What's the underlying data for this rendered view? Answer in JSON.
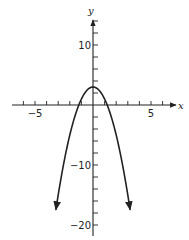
{
  "chart_data": {
    "type": "line",
    "title": "",
    "xlabel": "x",
    "ylabel": "y",
    "xlim": [
      -7.5,
      7.5
    ],
    "ylim": [
      -22,
      15
    ],
    "x_ticks": [
      -6,
      -5,
      -4,
      -3,
      -2,
      -1,
      1,
      2,
      3,
      4,
      5,
      6
    ],
    "x_tick_labels": [
      {
        "value": -5,
        "label": "−5"
      },
      {
        "value": 5,
        "label": "5"
      }
    ],
    "y_ticks": [
      14,
      12,
      10,
      8,
      6,
      4,
      2,
      -2,
      -4,
      -6,
      -8,
      -10,
      -12,
      -14,
      -16,
      -18,
      -20
    ],
    "y_tick_labels": [
      {
        "value": 10,
        "label": "10"
      },
      {
        "value": -10,
        "label": "−10"
      },
      {
        "value": -20,
        "label": "−20"
      }
    ],
    "grid": false,
    "series": [
      {
        "name": "y = 3 - 2x^2",
        "equation": "y = 3 - 2x^2",
        "x_range": [
          -3.2,
          3.2
        ],
        "vertex": [
          0,
          3
        ],
        "roots": [
          -1.22,
          1.22
        ],
        "end_arrows": true,
        "color": "#222222"
      }
    ]
  },
  "labels": {
    "x_axis": "x",
    "y_axis": "y"
  }
}
